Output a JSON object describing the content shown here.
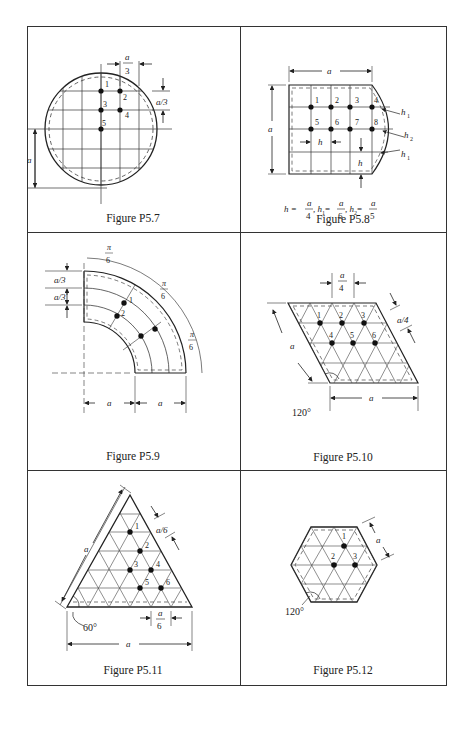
{
  "figures": [
    {
      "id": "P5.7",
      "caption": "Figure P5.7",
      "labels": {
        "top_dim": "a",
        "top_dim_den": "3",
        "right_dim": "a/3",
        "left_dim": "a"
      },
      "nodes": [
        "1",
        "2",
        "3",
        "4",
        "5"
      ]
    },
    {
      "id": "P5.8",
      "caption": "Figure P5.8",
      "labels": {
        "top_dim": "a",
        "left_dim": "a",
        "h": "h",
        "h1": "h",
        "h1_sub": "1",
        "h2": "h",
        "h2_sub": "2",
        "formula": {
          "h_lhs": "h =",
          "h_num": "a",
          "h_den": "4",
          "h1_lhs": ", h",
          "h1_sub": "1",
          "h1_eq": " =",
          "h1_num": "a",
          "h1_den": "6",
          "h2_lhs": ", h",
          "h2_sub": "2",
          "h2_eq": " =",
          "h2_num": "a",
          "h2_den": "5"
        }
      },
      "nodes": [
        "1",
        "2",
        "3",
        "4",
        "5",
        "6",
        "7",
        "8"
      ]
    },
    {
      "id": "P5.9",
      "caption": "Figure P5.9",
      "labels": {
        "left_dim1": "a/3",
        "left_dim2": "a/3",
        "pi": "π",
        "six": "6",
        "bottom_dim1": "a",
        "bottom_dim2": "a"
      },
      "nodes": [
        "1",
        "2"
      ]
    },
    {
      "id": "P5.10",
      "caption": "Figure P5.10",
      "labels": {
        "top_dim_num": "a",
        "top_dim_den": "4",
        "right_dim": "a/4",
        "left_dim": "a",
        "bottom_dim": "a",
        "angle": "120°"
      },
      "nodes": [
        "1",
        "2",
        "3",
        "4",
        "5",
        "6"
      ]
    },
    {
      "id": "P5.11",
      "caption": "Figure P5.11",
      "labels": {
        "right_dim": "a/6",
        "left_dim": "a",
        "bottom_small_num": "a",
        "bottom_small_den": "6",
        "bottom_dim": "a",
        "angle": "60°"
      },
      "nodes": [
        "1",
        "2",
        "3",
        "4",
        "5",
        "6"
      ]
    },
    {
      "id": "P5.12",
      "caption": "Figure P5.12",
      "labels": {
        "right_dim": "a",
        "angle": "120°"
      },
      "nodes": [
        "1",
        "2",
        "3"
      ]
    }
  ]
}
